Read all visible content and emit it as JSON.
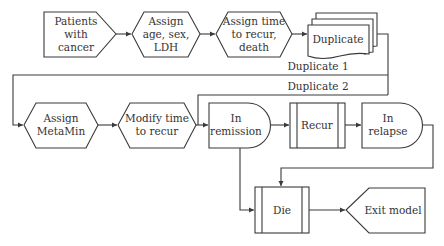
{
  "diagram": {
    "type": "flowchart",
    "nodes": {
      "patients": {
        "lines": [
          "Patients",
          "with",
          "cancer"
        ],
        "shape": "pentagon-start"
      },
      "assign_age": {
        "lines": [
          "Assign",
          "age, sex,",
          "LDH"
        ],
        "shape": "hexagon"
      },
      "assign_time": {
        "lines": [
          "Assign time",
          "to recur,",
          "death"
        ],
        "shape": "hexagon"
      },
      "duplicate": {
        "lines": [
          "Duplicate"
        ],
        "shape": "multi-document"
      },
      "assign_metamin": {
        "lines": [
          "Assign",
          "MetaMin"
        ],
        "shape": "hexagon"
      },
      "modify_time": {
        "lines": [
          "Modify time",
          "to recur"
        ],
        "shape": "hexagon"
      },
      "in_remission": {
        "lines": [
          "In",
          "remission"
        ],
        "shape": "delay"
      },
      "recur": {
        "lines": [
          "Recur"
        ],
        "shape": "predefined-process"
      },
      "in_relapse": {
        "lines": [
          "In",
          "relapse"
        ],
        "shape": "delay"
      },
      "die": {
        "lines": [
          "Die"
        ],
        "shape": "predefined-process"
      },
      "exit_model": {
        "lines": [
          "Exit model"
        ],
        "shape": "pentagon-end"
      }
    },
    "edges": {
      "duplicate_1": "Duplicate 1",
      "duplicate_2": "Duplicate 2"
    },
    "colors": {
      "stroke": "#3a3a3a",
      "text": "#333333",
      "background": "#ffffff"
    }
  }
}
